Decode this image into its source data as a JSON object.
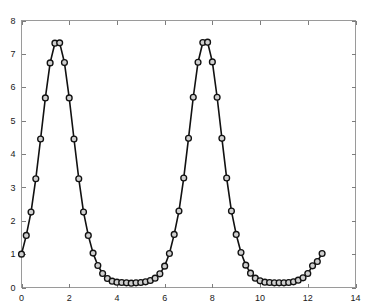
{
  "figure": {
    "background_color": "#ffffff",
    "axis_color": "#9a9a9a",
    "line_color": "#111111",
    "marker_face_color": "#cfcfcf",
    "marker_edge_color": "#111111"
  },
  "chart_data": {
    "type": "line",
    "title": "",
    "subtitle": "",
    "xlabel": "",
    "ylabel": "",
    "xlim": [
      0,
      14
    ],
    "ylim": [
      0,
      8
    ],
    "grid": false,
    "legend": null,
    "legend_position": "none",
    "marker": "circle",
    "marker_size": 4,
    "line_style": "solid",
    "x_ticks": [
      0,
      2,
      4,
      6,
      8,
      10,
      12,
      14
    ],
    "x_tick_labels": [
      "0",
      "2",
      "4",
      "6",
      "8",
      "10",
      "12",
      "14"
    ],
    "y_ticks": [
      0,
      1,
      2,
      3,
      4,
      5,
      6,
      7,
      8
    ],
    "y_tick_labels": [
      "0",
      "1",
      "2",
      "3",
      "4",
      "5",
      "6",
      "7",
      "8"
    ],
    "series": [
      {
        "name": "series-1",
        "x": [
          0.0,
          0.2,
          0.4,
          0.6,
          0.8,
          1.0,
          1.2,
          1.4,
          1.6,
          1.8,
          2.0,
          2.2,
          2.4,
          2.6,
          2.8,
          3.0,
          3.2,
          3.4,
          3.6,
          3.8,
          4.0,
          4.2,
          4.4,
          4.6,
          4.8,
          5.0,
          5.2,
          5.4,
          5.6,
          5.8,
          6.0,
          6.2,
          6.4,
          6.6,
          6.8,
          7.0,
          7.2,
          7.4,
          7.6,
          7.8,
          8.0,
          8.2,
          8.4,
          8.6,
          8.8,
          9.0,
          9.2,
          9.4,
          9.6,
          9.8,
          10.0,
          10.2,
          10.4,
          10.6,
          10.8,
          11.0,
          11.2,
          11.4,
          11.6,
          11.8,
          12.0,
          12.2,
          12.4,
          12.6
        ],
        "y": [
          1.0,
          1.56,
          2.26,
          3.26,
          4.45,
          5.68,
          6.73,
          7.32,
          7.33,
          6.74,
          5.68,
          4.45,
          3.26,
          2.26,
          1.56,
          1.03,
          0.66,
          0.42,
          0.27,
          0.19,
          0.16,
          0.15,
          0.14,
          0.13,
          0.14,
          0.15,
          0.17,
          0.21,
          0.28,
          0.41,
          0.64,
          1.02,
          1.59,
          2.29,
          3.28,
          4.47,
          5.7,
          6.75,
          7.34,
          7.35,
          6.76,
          5.7,
          4.47,
          3.28,
          2.29,
          1.59,
          1.05,
          0.67,
          0.43,
          0.28,
          0.2,
          0.16,
          0.15,
          0.14,
          0.14,
          0.14,
          0.15,
          0.17,
          0.22,
          0.29,
          0.42,
          0.65,
          0.78,
          1.02
        ]
      }
    ],
    "peaks": [
      {
        "x": 1.6,
        "y": 7.33
      },
      {
        "x": 7.8,
        "y": 7.35
      }
    ],
    "troughs": [
      {
        "x": 4.6,
        "y": 0.13
      },
      {
        "x": 10.8,
        "y": 0.14
      }
    ],
    "start_point": {
      "x": 0.0,
      "y": 1.0
    },
    "end_point": {
      "x": 12.6,
      "y": 1.02
    },
    "period_estimate": 6.28,
    "point_count": 64
  }
}
